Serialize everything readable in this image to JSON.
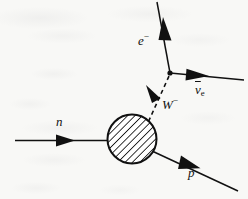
{
  "figure": {
    "kind": "feynman-diagram",
    "process_name": "Neutron beta decay",
    "background_color": "#f8f8f6",
    "ink_color": "#111111"
  },
  "labels": {
    "electron": "e",
    "electron_charge": "−",
    "neutron": "n",
    "wboson": "W",
    "wboson_charge": "−",
    "antineutrino_symbol": "ν",
    "antineutrino_subscript": "e",
    "proton": "p"
  },
  "elements": {
    "blob": {
      "name": "hadronic-blob",
      "style": "hatched-circle",
      "cx": 132,
      "cy": 139,
      "r": 25
    },
    "lines": [
      {
        "name": "neutron-line",
        "style": "solid",
        "label": "n",
        "arrow": "right"
      },
      {
        "name": "proton-line",
        "style": "solid",
        "label": "p",
        "arrow": "down-right"
      },
      {
        "name": "w-boson-line",
        "style": "dashed",
        "label": "W",
        "arrow": "up-left"
      },
      {
        "name": "electron-line",
        "style": "solid",
        "label": "e",
        "arrow": "up"
      },
      {
        "name": "antineutrino-line",
        "style": "solid",
        "label": "ν",
        "arrow": "right"
      }
    ],
    "vertex": {
      "name": "weak-vertex",
      "x": 170,
      "y": 73
    }
  }
}
